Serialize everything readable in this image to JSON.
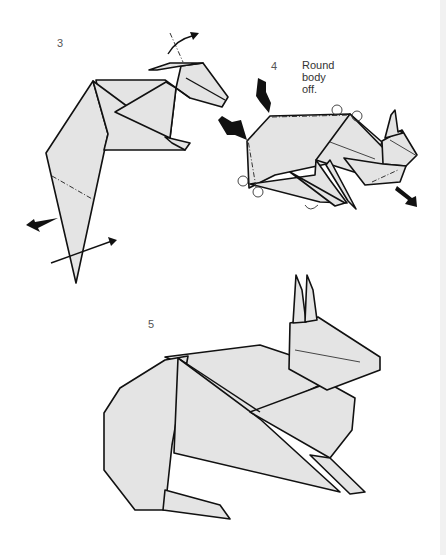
{
  "steps": [
    {
      "number": "3",
      "instruction": ""
    },
    {
      "number": "4",
      "instruction": "Round\nbody\noff."
    },
    {
      "number": "5",
      "instruction": ""
    }
  ],
  "colors": {
    "paper_fill": "#e4e4e4",
    "line": "#111111",
    "background": "#ffffff"
  },
  "icons": [
    "push-arrow-icon",
    "fold-arrow-icon",
    "curved-arrow-icon",
    "mountain-fold-line"
  ]
}
